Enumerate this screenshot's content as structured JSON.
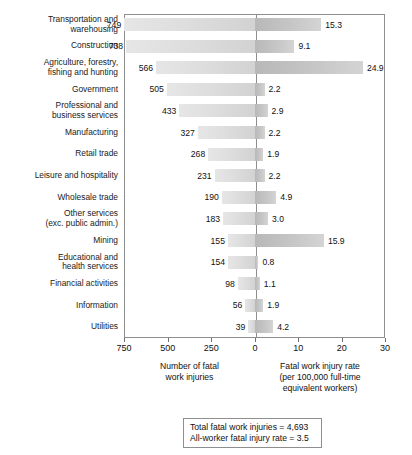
{
  "chart_data": {
    "type": "bar",
    "orientation": "horizontal-diverging",
    "title": "",
    "categories": [
      "Transportation and warehousing",
      "Construction",
      "Agriculture, forestry, fishing and hunting",
      "Government",
      "Professional and business services",
      "Manufacturing",
      "Retail trade",
      "Leisure and hospitality",
      "Wholesale trade",
      "Other services (exc. public admin.)",
      "Mining",
      "Educational and health services",
      "Financial activities",
      "Information",
      "Utilities"
    ],
    "category_lines": [
      [
        "Transportation and",
        "warehousing"
      ],
      [
        "Construction"
      ],
      [
        "Agriculture, forestry,",
        "fishing and hunting"
      ],
      [
        "Government"
      ],
      [
        "Professional and",
        "business services"
      ],
      [
        "Manufacturing"
      ],
      [
        "Retail trade"
      ],
      [
        "Leisure and hospitality"
      ],
      [
        "Wholesale trade"
      ],
      [
        "Other services",
        "(exc. public admin.)"
      ],
      [
        "Mining"
      ],
      [
        "Educational and",
        "health services"
      ],
      [
        "Financial activities"
      ],
      [
        "Information"
      ],
      [
        "Utilities"
      ]
    ],
    "series": [
      {
        "name": "Number of fatal work injuries",
        "side": "left",
        "values": [
          749,
          738,
          566,
          505,
          433,
          327,
          268,
          231,
          190,
          183,
          155,
          154,
          98,
          56,
          39
        ],
        "labels": [
          "749",
          "738",
          "566",
          "505",
          "433",
          "327",
          "268",
          "231",
          "190",
          "183",
          "155",
          "154",
          "98",
          "56",
          "39"
        ],
        "axis_max": 750,
        "axis_ticks": [
          750,
          500,
          250,
          0
        ],
        "axis_tick_labels": [
          "750",
          "500",
          "250",
          "0"
        ]
      },
      {
        "name": "Fatal work injury rate (per 100,000 full-time equivalent workers)",
        "side": "right",
        "values": [
          15.3,
          9.1,
          24.9,
          2.2,
          2.9,
          2.2,
          1.9,
          2.2,
          4.9,
          3.0,
          15.9,
          0.8,
          1.1,
          1.9,
          4.2
        ],
        "labels": [
          "15.3",
          "9.1",
          "24.9",
          "2.2",
          "2.9",
          "2.2",
          "1.9",
          "2.2",
          "4.9",
          "3.0",
          "15.9",
          "0.8",
          "1.1",
          "1.9",
          "4.2"
        ],
        "axis_max": 30,
        "axis_ticks": [
          0,
          10,
          20,
          30
        ],
        "axis_tick_labels": [
          "0",
          "10",
          "20",
          "30"
        ]
      }
    ],
    "axis_caption_left": [
      "Number of fatal",
      "work injuries"
    ],
    "axis_caption_right": [
      "Fatal work injury rate",
      "(per 100,000 full-time",
      "equivalent workers)"
    ],
    "grid": false,
    "legend": "none",
    "colors": {
      "bar_left": "#dedede",
      "bar_right": "#c6c6c6",
      "frame": "#8e8e8e",
      "text": "#111111"
    }
  },
  "footer": {
    "lines": [
      "Total fatal work injuries = 4,693",
      "All-worker fatal injury rate = 3.5"
    ]
  }
}
